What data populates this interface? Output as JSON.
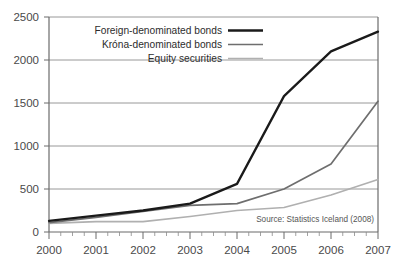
{
  "chart_data": {
    "type": "line",
    "title": "",
    "xlabel": "",
    "ylabel": "",
    "categories": [
      "2000",
      "2001",
      "2002",
      "2003",
      "2004",
      "2005",
      "2006",
      "2007"
    ],
    "x": [
      2000,
      2001,
      2002,
      2003,
      2004,
      2005,
      2006,
      2007
    ],
    "xlim": [
      2000,
      2007
    ],
    "ylim": [
      0,
      2500
    ],
    "yticks": [
      0,
      500,
      1000,
      1500,
      2000,
      2500
    ],
    "ytick_labels": [
      "0",
      "500",
      "1000",
      "1500",
      "2000",
      "2500"
    ],
    "grid": "horizontal",
    "legend_position": "top-left",
    "series": [
      {
        "name": "Foreign-denominated bonds",
        "color": "#1a1a1a",
        "width": 2.3,
        "values": [
          130,
          190,
          250,
          330,
          560,
          1580,
          2100,
          2330
        ]
      },
      {
        "name": "Króna-denominated bonds",
        "color": "#6e6e6e",
        "width": 1.7,
        "values": [
          110,
          170,
          240,
          310,
          330,
          500,
          790,
          1520
        ]
      },
      {
        "name": "Equity securities",
        "color": "#b0b0b0",
        "width": 1.7,
        "values": [
          100,
          120,
          120,
          180,
          250,
          285,
          430,
          610
        ]
      }
    ],
    "annotations": [
      {
        "name": "source-note",
        "text": "Source: Statistics Iceland (2008)"
      }
    ]
  },
  "legend": {
    "items": [
      {
        "label": "Foreign-denominated bonds"
      },
      {
        "label": "Króna-denominated bonds"
      },
      {
        "label": "Equity securities"
      }
    ]
  },
  "axes": {
    "y_tick_labels": [
      "2500",
      "2000",
      "1500",
      "1000",
      "500",
      "0"
    ],
    "x_tick_labels": [
      "2000",
      "2001",
      "2002",
      "2003",
      "2004",
      "2005",
      "2006",
      "2007"
    ]
  },
  "source": {
    "text": "Source: Statistics Iceland (2008)"
  }
}
